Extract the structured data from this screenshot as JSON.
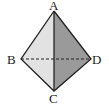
{
  "figure": {
    "type": "tetrahedron",
    "labels": {
      "A": "A",
      "B": "B",
      "C": "C",
      "D": "D"
    },
    "hidden_edge": "BD",
    "colors": {
      "left_face": "#e2e2e2",
      "right_face": "#9a9a9a",
      "edge": "#222222"
    }
  }
}
